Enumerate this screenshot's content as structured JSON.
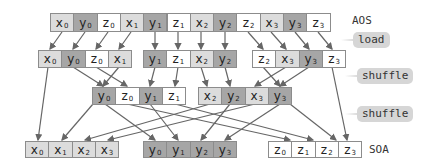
{
  "labels": {
    "aos": "AOS",
    "soa": "SOA",
    "load": "load",
    "shuffle1": "shuffle",
    "shuffle2": "shuffle"
  },
  "colors": {
    "x": "#dcdcdc",
    "y": "#a6a6a6",
    "z": "#ffffff",
    "border": "#8c8c8c",
    "arrow": "#666666",
    "tag": "#d6d6d6"
  },
  "rows": {
    "aos": [
      {
        "v": "x",
        "i": "0"
      },
      {
        "v": "y",
        "i": "0"
      },
      {
        "v": "z",
        "i": "0"
      },
      {
        "v": "x",
        "i": "1"
      },
      {
        "v": "y",
        "i": "1"
      },
      {
        "v": "z",
        "i": "1"
      },
      {
        "v": "x",
        "i": "2"
      },
      {
        "v": "y",
        "i": "2"
      },
      {
        "v": "z",
        "i": "2"
      },
      {
        "v": "x",
        "i": "3"
      },
      {
        "v": "y",
        "i": "3"
      },
      {
        "v": "z",
        "i": "3"
      }
    ],
    "load": [
      [
        {
          "v": "x",
          "i": "0"
        },
        {
          "v": "y",
          "i": "0"
        },
        {
          "v": "z",
          "i": "0"
        },
        {
          "v": "x",
          "i": "1"
        }
      ],
      [
        {
          "v": "y",
          "i": "1"
        },
        {
          "v": "z",
          "i": "1"
        },
        {
          "v": "x",
          "i": "2"
        },
        {
          "v": "y",
          "i": "2"
        }
      ],
      [
        {
          "v": "z",
          "i": "2"
        },
        {
          "v": "x",
          "i": "3"
        },
        {
          "v": "y",
          "i": "3"
        },
        {
          "v": "z",
          "i": "3"
        }
      ]
    ],
    "shuffle": [
      [
        {
          "v": "y",
          "i": "0"
        },
        {
          "v": "z",
          "i": "0"
        },
        {
          "v": "y",
          "i": "1"
        },
        {
          "v": "z",
          "i": "1"
        }
      ],
      [
        {
          "v": "x",
          "i": "2"
        },
        {
          "v": "y",
          "i": "2"
        },
        {
          "v": "x",
          "i": "3"
        },
        {
          "v": "y",
          "i": "3"
        }
      ]
    ],
    "soa": [
      [
        {
          "v": "x",
          "i": "0"
        },
        {
          "v": "x",
          "i": "1"
        },
        {
          "v": "x",
          "i": "2"
        },
        {
          "v": "x",
          "i": "3"
        }
      ],
      [
        {
          "v": "y",
          "i": "0"
        },
        {
          "v": "y",
          "i": "1"
        },
        {
          "v": "y",
          "i": "2"
        },
        {
          "v": "y",
          "i": "3"
        }
      ],
      [
        {
          "v": "z",
          "i": "0"
        },
        {
          "v": "z",
          "i": "1"
        },
        {
          "v": "z",
          "i": "2"
        },
        {
          "v": "z",
          "i": "3"
        }
      ]
    ]
  }
}
